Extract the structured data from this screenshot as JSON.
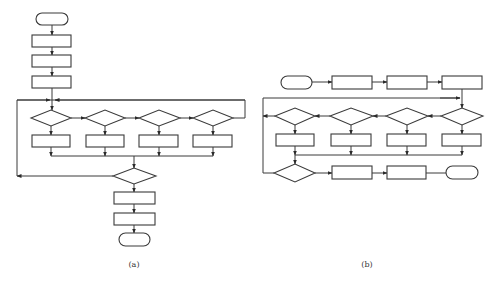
{
  "figure": {
    "panels": [
      {
        "id": "a",
        "caption": "(a)",
        "layout": "vertical flowchart with parallel decision row and loop-back",
        "nodes": [
          {
            "type": "terminal",
            "role": "start"
          },
          {
            "type": "process"
          },
          {
            "type": "process"
          },
          {
            "type": "process"
          },
          {
            "type": "decision",
            "row": "parallel",
            "index": 1
          },
          {
            "type": "decision",
            "row": "parallel",
            "index": 2
          },
          {
            "type": "decision",
            "row": "parallel",
            "index": 3
          },
          {
            "type": "decision",
            "row": "parallel",
            "index": 4
          },
          {
            "type": "process",
            "row": "parallel",
            "index": 1
          },
          {
            "type": "process",
            "row": "parallel",
            "index": 2
          },
          {
            "type": "process",
            "row": "parallel",
            "index": 3
          },
          {
            "type": "process",
            "row": "parallel",
            "index": 4
          },
          {
            "type": "decision",
            "role": "loop-check"
          },
          {
            "type": "process"
          },
          {
            "type": "process"
          },
          {
            "type": "terminal",
            "role": "end"
          }
        ]
      },
      {
        "id": "b",
        "caption": "(b)",
        "layout": "horizontal flowchart with parallel decision row and loop-back",
        "nodes": [
          {
            "type": "terminal",
            "role": "start"
          },
          {
            "type": "process"
          },
          {
            "type": "process"
          },
          {
            "type": "process"
          },
          {
            "type": "decision",
            "row": "parallel",
            "index": 1
          },
          {
            "type": "decision",
            "row": "parallel",
            "index": 2
          },
          {
            "type": "decision",
            "row": "parallel",
            "index": 3
          },
          {
            "type": "decision",
            "row": "parallel",
            "index": 4
          },
          {
            "type": "process",
            "row": "parallel",
            "index": 1
          },
          {
            "type": "process",
            "row": "parallel",
            "index": 2
          },
          {
            "type": "process",
            "row": "parallel",
            "index": 3
          },
          {
            "type": "process",
            "row": "parallel",
            "index": 4
          },
          {
            "type": "decision",
            "role": "loop-check"
          },
          {
            "type": "process"
          },
          {
            "type": "process"
          },
          {
            "type": "terminal",
            "role": "end"
          }
        ]
      }
    ]
  },
  "colors": {
    "stroke": "#3a3a3a",
    "background": "#ffffff"
  }
}
